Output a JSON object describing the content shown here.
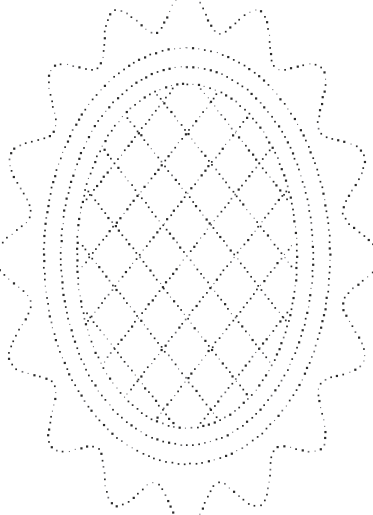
{
  "document": {
    "title": "Dotted Oval Medallion Pricked Pattern",
    "medium": "pricked / pounce pattern on white paper",
    "background_color": "#ffffff",
    "dot_color": "#2b2b2b",
    "dot_color_light": "#6e6e72"
  },
  "canvas": {
    "width": 373,
    "height": 515,
    "center_x": 187,
    "center_y": 258
  },
  "chart_data": {
    "type": "scatter",
    "subtitle": "Scalloped border with three concentric ovals and diamond lattice fill",
    "xlabel": "",
    "ylabel": "",
    "xlim": [
      0,
      373
    ],
    "ylim": [
      0,
      515
    ],
    "grid": false,
    "legend": false,
    "marker": "square-dot",
    "marker_size_px": 1.7,
    "series": [
      {
        "name": "scalloped-outer-border",
        "shape": "scalloped-oval",
        "center": [
          187,
          258
        ],
        "radius_x": 176,
        "radius_y": 249,
        "lobes": 16,
        "lobe_depth": 11,
        "lobe_phase_deg": -90,
        "dot_spacing_px": 6.1,
        "color": "#2b2b2b"
      },
      {
        "name": "outer-oval-ring",
        "shape": "ellipse",
        "center": [
          187,
          256
        ],
        "radius_x": 143,
        "radius_y": 208,
        "dot_spacing_px": 6.0,
        "color": "#2b2b2b"
      },
      {
        "name": "middle-oval-ring",
        "shape": "ellipse",
        "center": [
          187,
          256
        ],
        "radius_x": 126,
        "radius_y": 189,
        "dot_spacing_px": 5.9,
        "color": "#2b2b2b"
      },
      {
        "name": "inner-oval-ring",
        "shape": "ellipse",
        "center": [
          187,
          256
        ],
        "radius_x": 110,
        "radius_y": 172,
        "dot_spacing_px": 5.8,
        "color": "#2b2b2b"
      },
      {
        "name": "lattice-diagonals-right",
        "shape": "parallel-lines",
        "angle_deg": 52,
        "spacing_px": 38,
        "count": 11,
        "clip": "inner-oval-ring",
        "dot_spacing_px": 5.6,
        "color": "#2b2b2b"
      },
      {
        "name": "lattice-diagonals-left",
        "shape": "parallel-lines",
        "angle_deg": -52,
        "spacing_px": 38,
        "count": 11,
        "clip": "inner-oval-ring",
        "dot_spacing_px": 5.6,
        "color": "#2b2b2b"
      }
    ]
  },
  "geometry": {
    "scallop": {
      "center_x": 187,
      "center_y": 258,
      "rx": 176,
      "ry": 249,
      "lobes": 16,
      "amp": 11,
      "phase_deg": -90,
      "spacing": 6.1
    },
    "ovals": [
      {
        "name": "outer-oval-ring",
        "cx": 187,
        "cy": 256,
        "rx": 143,
        "ry": 208,
        "spacing": 6.0
      },
      {
        "name": "middle-oval-ring",
        "cx": 187,
        "cy": 256,
        "rx": 126,
        "ry": 189,
        "spacing": 5.9
      },
      {
        "name": "inner-oval-ring",
        "cx": 187,
        "cy": 256,
        "rx": 110,
        "ry": 172,
        "spacing": 5.8
      }
    ],
    "lattice": {
      "cx": 187,
      "cy": 256,
      "rx": 110,
      "ry": 172,
      "angle_deg": 52,
      "spacing": 38,
      "dot_spacing": 5.6,
      "count_each_side": 6
    }
  }
}
